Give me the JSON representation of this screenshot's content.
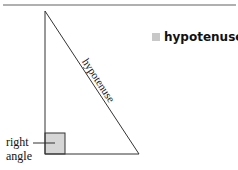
{
  "legend": {
    "label": "hypotenuse",
    "swatch_color": "#c8c8c8"
  },
  "diagram": {
    "hypotenuse_label": "hypotenuse",
    "right_angle_label_line1": "right",
    "right_angle_label_line2": "angle",
    "right_angle_fill": "#d6d6d6",
    "top_rule_color": "#b0b0b0"
  }
}
